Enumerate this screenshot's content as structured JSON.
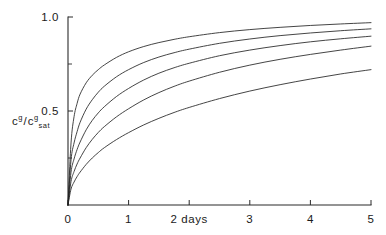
{
  "figure": {
    "background_color": "#ffffff",
    "line_color": "#232323",
    "axis_color": "#2b2b2b",
    "y_axis_label_parts": {
      "numerator_base": "c",
      "numerator_sup": "g",
      "slash": "/",
      "denominator_base": "c",
      "denominator_sup": "g",
      "denominator_sub": "sat"
    }
  },
  "chart_data": {
    "type": "line",
    "title": "",
    "subtitle": "",
    "xlabel": "days",
    "ylabel": "c^g/c^g_sat",
    "xlim": [
      0,
      5
    ],
    "ylim": [
      0,
      1.0
    ],
    "grid": false,
    "legend": "none",
    "x_tick_labels": [
      "0",
      "1",
      "2 days",
      "3",
      "4",
      "5"
    ],
    "x_tick_values": [
      0,
      1,
      2,
      3,
      4,
      5
    ],
    "y_tick_labels": [
      "0.5",
      "1.0"
    ],
    "y_tick_values": [
      0.5,
      1.0
    ],
    "y_minor_tick_values": [
      0.25,
      0.75
    ],
    "x": [
      0,
      0.05,
      0.1,
      0.15,
      0.2,
      0.3,
      0.4,
      0.5,
      0.6,
      0.8,
      1.0,
      1.25,
      1.5,
      1.75,
      2.0,
      2.5,
      3.0,
      3.5,
      4.0,
      4.5,
      5.0
    ],
    "series": [
      {
        "name": "curve-1",
        "values": [
          0.0,
          0.33,
          0.47,
          0.54,
          0.59,
          0.65,
          0.69,
          0.72,
          0.745,
          0.785,
          0.815,
          0.843,
          0.864,
          0.881,
          0.895,
          0.917,
          0.933,
          0.945,
          0.955,
          0.963,
          0.97
        ]
      },
      {
        "name": "curve-2",
        "values": [
          0.0,
          0.24,
          0.33,
          0.39,
          0.44,
          0.51,
          0.56,
          0.6,
          0.632,
          0.682,
          0.72,
          0.758,
          0.787,
          0.81,
          0.829,
          0.86,
          0.883,
          0.901,
          0.915,
          0.927,
          0.937
        ]
      },
      {
        "name": "curve-3",
        "values": [
          0.0,
          0.175,
          0.245,
          0.295,
          0.335,
          0.4,
          0.45,
          0.49,
          0.523,
          0.577,
          0.62,
          0.665,
          0.701,
          0.73,
          0.754,
          0.794,
          0.824,
          0.848,
          0.868,
          0.884,
          0.898
        ]
      },
      {
        "name": "curve-4",
        "values": [
          0.0,
          0.125,
          0.178,
          0.218,
          0.25,
          0.305,
          0.349,
          0.386,
          0.417,
          0.469,
          0.512,
          0.559,
          0.598,
          0.631,
          0.659,
          0.706,
          0.744,
          0.775,
          0.801,
          0.824,
          0.845
        ]
      },
      {
        "name": "curve-5",
        "values": [
          0.0,
          0.085,
          0.122,
          0.151,
          0.175,
          0.216,
          0.25,
          0.279,
          0.305,
          0.348,
          0.385,
          0.426,
          0.461,
          0.492,
          0.519,
          0.566,
          0.606,
          0.64,
          0.67,
          0.697,
          0.72
        ]
      }
    ]
  }
}
